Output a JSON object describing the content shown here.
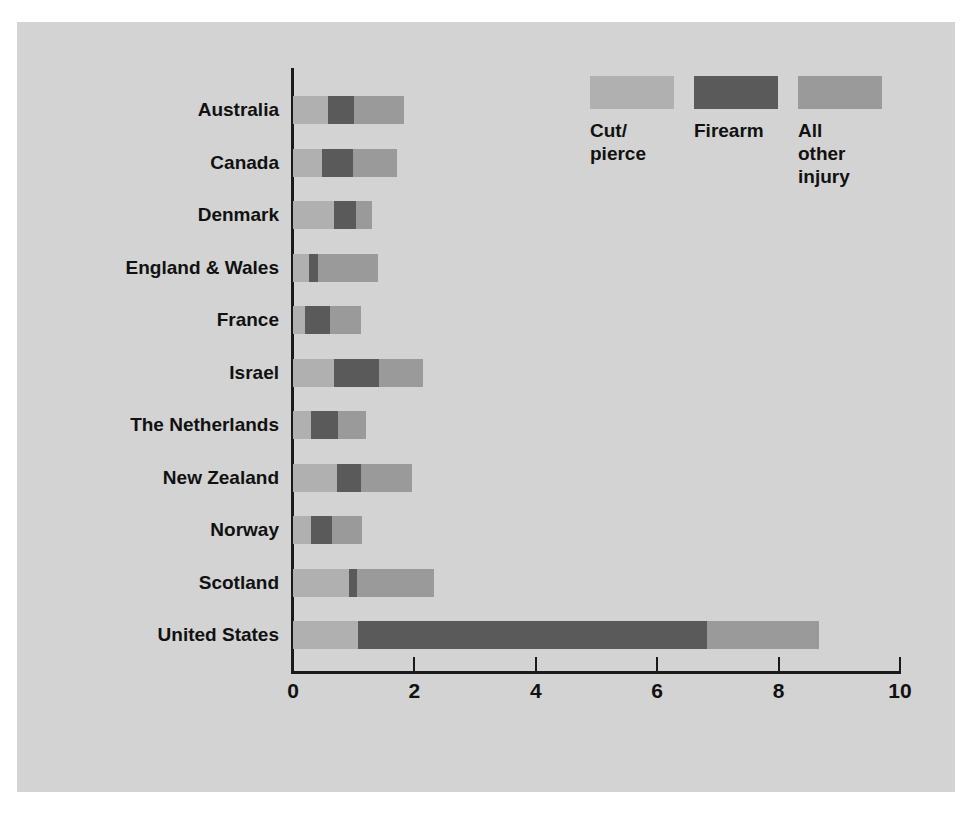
{
  "chart_data": {
    "type": "bar",
    "orientation": "horizontal",
    "stacked": true,
    "title": "",
    "subtitle": "",
    "xlabel": "",
    "ylabel": "",
    "xlim": [
      0,
      10
    ],
    "xticks": [
      0,
      2,
      4,
      6,
      8,
      10
    ],
    "xtick_labels": [
      "0",
      "2",
      "4",
      "6",
      "8",
      "10"
    ],
    "grid": false,
    "legend_position": "top-right",
    "categories": [
      "Australia",
      "Canada",
      "Denmark",
      "England & Wales",
      "France",
      "Israel",
      "The Netherlands",
      "New Zealand",
      "Norway",
      "Scotland",
      "United States"
    ],
    "series": [
      {
        "name": "Cut/pierce",
        "color": "#b0b0b0",
        "values": [
          0.58,
          0.48,
          0.68,
          0.26,
          0.2,
          0.68,
          0.3,
          0.72,
          0.3,
          0.92,
          1.07
        ]
      },
      {
        "name": "Firearm",
        "color": "#5a5a5a",
        "values": [
          0.43,
          0.51,
          0.35,
          0.15,
          0.41,
          0.74,
          0.44,
          0.4,
          0.35,
          0.13,
          5.75
        ]
      },
      {
        "name": "All other injury",
        "color": "#9a9a9a",
        "values": [
          0.82,
          0.72,
          0.27,
          0.99,
          0.51,
          0.72,
          0.46,
          0.84,
          0.49,
          1.27,
          1.85
        ]
      }
    ],
    "totals": [
      1.83,
      1.71,
      1.3,
      1.4,
      1.12,
      2.14,
      1.2,
      1.96,
      1.14,
      2.32,
      8.67
    ]
  },
  "legend": {
    "items": [
      {
        "label": "Cut/\npierce",
        "label_lines": [
          "Cut/",
          "pierce"
        ],
        "swatch": "legend-swatch-cut-pierce"
      },
      {
        "label": "Firearm",
        "label_lines": [
          "Firearm"
        ],
        "swatch": "legend-swatch-firearm"
      },
      {
        "label": "All\nother\ninjury",
        "label_lines": [
          "All",
          "other",
          "injury"
        ],
        "swatch": "legend-swatch-all-other"
      }
    ]
  },
  "colors": {
    "background": "#d3d3d3",
    "page": "#ffffff",
    "axis": "#1a1a1a",
    "text": "#111111",
    "cut_pierce": "#b0b0b0",
    "firearm": "#5a5a5a",
    "all_other_injury": "#9a9a9a"
  }
}
